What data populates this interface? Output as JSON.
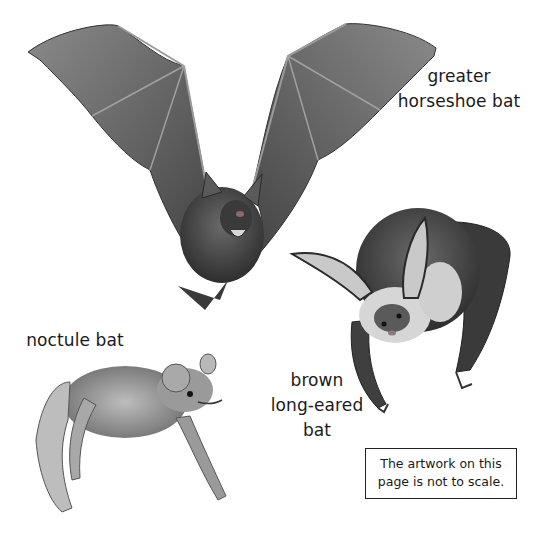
{
  "page": {
    "background": "#ffffff",
    "labels": {
      "greater_horseshoe": {
        "lines": [
          "greater",
          "horseshoe bat"
        ]
      },
      "noctule": {
        "lines": [
          "noctule bat"
        ]
      },
      "brown_long_eared": {
        "lines": [
          "brown",
          "long-eared",
          "bat"
        ]
      }
    },
    "note": {
      "lines": [
        "The artwork on this",
        "page is not to scale."
      ]
    },
    "illustrations": [
      {
        "name": "greater horseshoe bat",
        "pose": "flying, wings spread"
      },
      {
        "name": "brown long-eared bat",
        "pose": "hanging, large ears"
      },
      {
        "name": "noctule bat",
        "pose": "crawling"
      }
    ],
    "colors": {
      "text": "#1a1a1a",
      "wing": "#6b6b6b",
      "wing_dark": "#3e3e3e",
      "fur": "#4a4a4a",
      "ear_light": "#c9c9c9"
    }
  }
}
